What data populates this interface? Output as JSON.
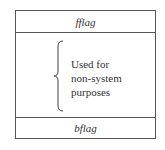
{
  "diagram": {
    "top_field": "fflag",
    "bottom_field": "bflag",
    "middle_description": [
      "Used for",
      "non-system",
      "purposes"
    ]
  }
}
